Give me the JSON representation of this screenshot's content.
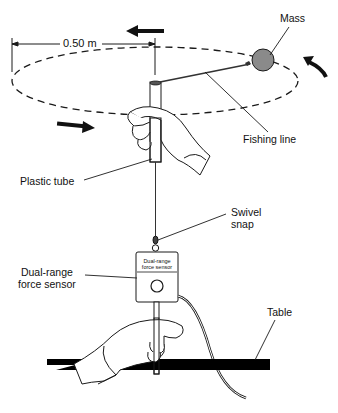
{
  "diagram": {
    "dimension_label": "0.50 m",
    "labels": {
      "mass": "Mass",
      "fishing_line": "Fishing line",
      "plastic_tube": "Plastic tube",
      "swivel_snap_line1": "Swivel",
      "swivel_snap_line2": "snap",
      "force_sensor_line1": "Dual-range",
      "force_sensor_line2": "force sensor",
      "table": "Table"
    },
    "sensor_face_line1": "Dual-range",
    "sensor_face_line2": "force sensor",
    "colors": {
      "line": "#1a1a1a",
      "mass_fill": "#8a8a8a",
      "table": "#000000",
      "background": "#ffffff"
    }
  }
}
